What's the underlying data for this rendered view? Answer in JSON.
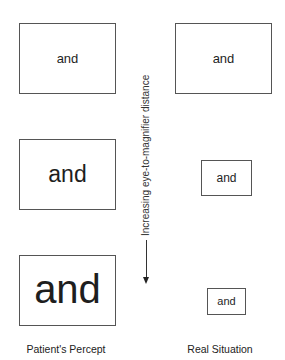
{
  "columns": {
    "left": {
      "label": "Patient's Percept"
    },
    "right": {
      "label": "Real Situation"
    }
  },
  "rows": [
    {
      "left_word": "and",
      "right_word": "and"
    },
    {
      "left_word": "and",
      "right_word": "and"
    },
    {
      "left_word": "and",
      "right_word": "and"
    }
  ],
  "axis": {
    "label": "Increasing eye-to-magnifier distance",
    "direction": "down"
  }
}
